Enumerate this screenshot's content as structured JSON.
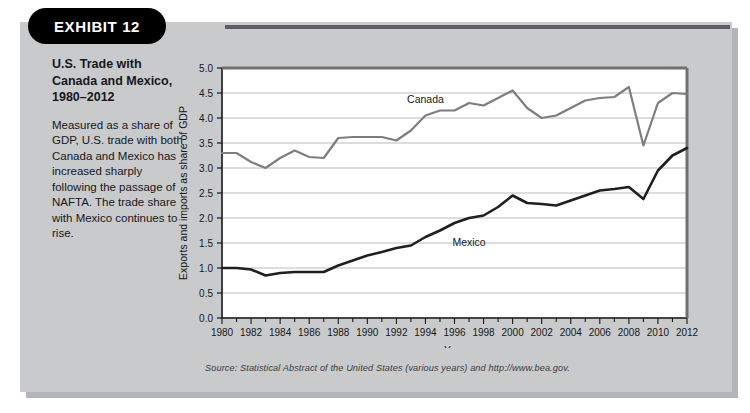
{
  "exhibit": {
    "tag_label": "EXHIBIT 12",
    "title": "U.S. Trade with Canada and Mexico, 1980–2012",
    "caption": "Measured as a share of GDP, U.S. trade with both Canada and Mexico has increased sharply following the passage of NAFTA. The trade share with Mexico continues to rise.",
    "source": "Source: Statistical Abstract of the United States (various years) and http://www.bea.gov."
  },
  "colors": {
    "panel": "#c9cacc",
    "plot_background": "#ffffff",
    "canada_line": "#7c7e82",
    "mexico_line": "#1d1f22",
    "gridline": "#b9bbbe",
    "axis": "#15171a",
    "tag_background": "#000000",
    "tag_text": "#ffffff"
  },
  "chart_data": {
    "type": "line",
    "title": "U.S. Trade with Canada and Mexico, 1980–2012",
    "xlabel": "Year",
    "ylabel": "Exports and imports as share of GDP",
    "xlim": [
      1980,
      2012
    ],
    "ylim": [
      0.0,
      5.0
    ],
    "ytick_step": 0.5,
    "xtick_step": 2,
    "grid": true,
    "legend_position": "inline-labels",
    "xticks": [
      1980,
      1982,
      1984,
      1986,
      1988,
      1990,
      1992,
      1994,
      1996,
      1998,
      2000,
      2002,
      2004,
      2006,
      2008,
      2010,
      2012
    ],
    "yticks": [
      "0.0",
      "0.5",
      "1.0",
      "1.5",
      "2.0",
      "2.5",
      "3.0",
      "3.5",
      "4.0",
      "4.5",
      "5.0"
    ],
    "x": [
      1980,
      1981,
      1982,
      1983,
      1984,
      1985,
      1986,
      1987,
      1988,
      1989,
      1990,
      1991,
      1992,
      1993,
      1994,
      1995,
      1996,
      1997,
      1998,
      1999,
      2000,
      2001,
      2002,
      2003,
      2004,
      2005,
      2006,
      2007,
      2008,
      2009,
      2010,
      2011,
      2012
    ],
    "series": [
      {
        "name": "Canada",
        "color": "#7c7e82",
        "label_x": 1994,
        "label_y": 4.3,
        "values": [
          3.3,
          3.3,
          3.12,
          3.0,
          3.2,
          3.35,
          3.22,
          3.2,
          3.6,
          3.62,
          3.62,
          3.62,
          3.55,
          3.75,
          4.05,
          4.15,
          4.15,
          4.3,
          4.25,
          4.4,
          4.55,
          4.2,
          4.0,
          4.05,
          4.2,
          4.35,
          4.4,
          4.42,
          4.62,
          3.45,
          4.3,
          4.5,
          4.48
        ]
      },
      {
        "name": "Mexico",
        "color": "#1d1f22",
        "label_x": 1997,
        "label_y": 1.45,
        "values": [
          1.0,
          1.0,
          0.97,
          0.85,
          0.9,
          0.92,
          0.92,
          0.92,
          1.05,
          1.15,
          1.25,
          1.32,
          1.4,
          1.45,
          1.62,
          1.75,
          1.9,
          2.0,
          2.05,
          2.22,
          2.45,
          2.3,
          2.28,
          2.25,
          2.35,
          2.45,
          2.55,
          2.58,
          2.62,
          2.38,
          2.95,
          3.25,
          3.4
        ]
      }
    ]
  }
}
